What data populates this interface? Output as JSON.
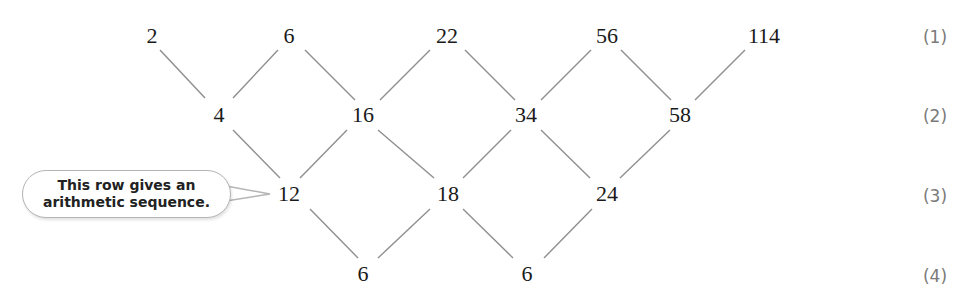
{
  "rows": [
    {
      "label": "(1)",
      "values": [
        "2",
        "6",
        "22",
        "56",
        "114"
      ]
    },
    {
      "label": "(2)",
      "values": [
        "4",
        "16",
        "34",
        "58"
      ]
    },
    {
      "label": "(3)",
      "values": [
        "12",
        "18",
        "24"
      ]
    },
    {
      "label": "(4)",
      "values": [
        "6",
        "6"
      ]
    }
  ],
  "callout": {
    "line1": "This row gives an",
    "line2": "arithmetic sequence."
  },
  "colors": {
    "line": "#8a8a8a",
    "text": "#1a1a1a",
    "label": "#7a7a7a"
  }
}
